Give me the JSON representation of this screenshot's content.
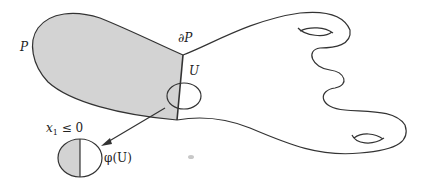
{
  "figure": {
    "labels": {
      "manifold": "P",
      "boundary": "∂P",
      "chart_domain": "U",
      "halfspace_condition_var": "x",
      "halfspace_condition_sub": "1",
      "halfspace_condition_rel": " ≤ 0",
      "chart_image": "φ(U)"
    },
    "colors": {
      "shade": "#d3d3d3",
      "stroke": "#333333",
      "background": "#ffffff"
    }
  }
}
